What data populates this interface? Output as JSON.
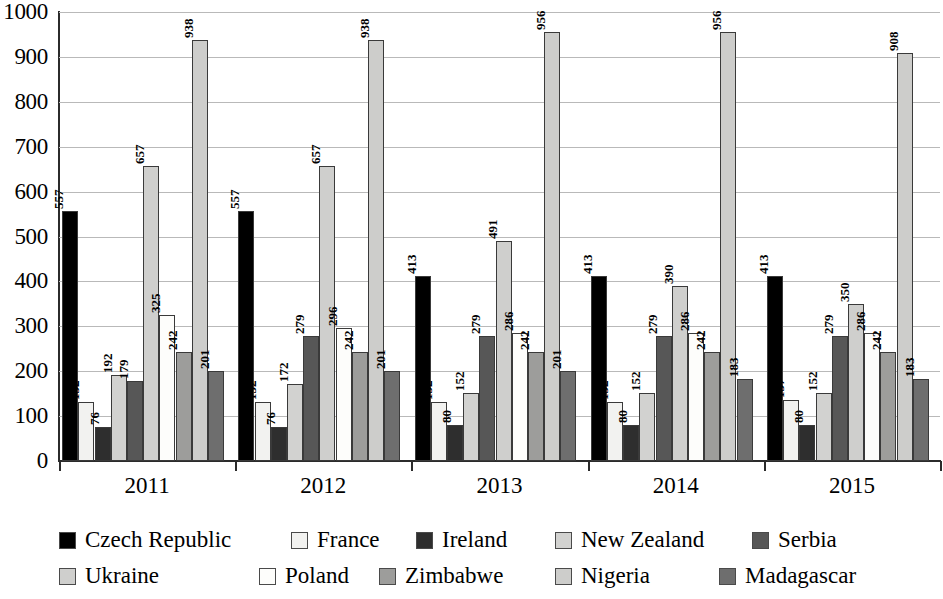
{
  "chart_data": {
    "type": "bar",
    "title": "",
    "subtitle": "",
    "xlabel": "",
    "ylabel": "",
    "categories": [
      "2011",
      "2012",
      "2013",
      "2014",
      "2015"
    ],
    "ylim": [
      0,
      1000
    ],
    "ytick_step": 100,
    "yticks": [
      "1000",
      "900",
      "800",
      "700",
      "600",
      "500",
      "400",
      "300",
      "200",
      "100",
      "0"
    ],
    "grid": true,
    "grid_axis": "y",
    "legend_position": "bottom",
    "data_labels": true,
    "data_label_orientation": "vertical",
    "series": [
      {
        "name": "Czech Republic",
        "color": "#000000",
        "values": [
          557,
          557,
          413,
          413,
          413
        ]
      },
      {
        "name": "France",
        "color": "#f2f2f0",
        "values": [
          132,
          132,
          132,
          132,
          137
        ]
      },
      {
        "name": "Ireland",
        "color": "#2e2e2e",
        "values": [
          76,
          76,
          80,
          80,
          80
        ]
      },
      {
        "name": "New Zealand",
        "color": "#d2d2d0",
        "values": [
          192,
          172,
          152,
          152,
          152
        ]
      },
      {
        "name": "Serbia",
        "color": "#575757",
        "values": [
          179,
          279,
          279,
          279,
          279
        ]
      },
      {
        "name": "Ukraine",
        "color": "#cfcfcd",
        "values": [
          657,
          657,
          491,
          390,
          350
        ]
      },
      {
        "name": "Poland",
        "color": "#fdfdfb",
        "values": [
          325,
          296,
          286,
          286,
          286
        ]
      },
      {
        "name": "Zimbabwe",
        "color": "#9d9d9b",
        "values": [
          242,
          242,
          242,
          242,
          242
        ]
      },
      {
        "name": "Nigeria",
        "color": "#cdcdcb",
        "values": [
          938,
          938,
          956,
          956,
          908
        ]
      },
      {
        "name": "Madagascar",
        "color": "#6e6e6e",
        "values": [
          201,
          201,
          201,
          183,
          183
        ]
      }
    ]
  },
  "legend": {
    "rows": [
      [
        {
          "label": "Czech Republic",
          "swatch": "#000000",
          "x": 0
        },
        {
          "label": "France",
          "swatch": "#f2f2f0",
          "x": 232
        },
        {
          "label": "Ireland",
          "swatch": "#2e2e2e",
          "x": 357
        },
        {
          "label": "New Zealand",
          "swatch": "#d2d2d0",
          "x": 496
        },
        {
          "label": "Serbia",
          "swatch": "#575757",
          "x": 693
        }
      ],
      [
        {
          "label": "Ukraine",
          "swatch": "#cfcfcd",
          "x": 0
        },
        {
          "label": "Poland",
          "swatch": "#fdfdfb",
          "x": 200
        },
        {
          "label": "Zimbabwe",
          "swatch": "#9d9d9b",
          "x": 320
        },
        {
          "label": "Nigeria",
          "swatch": "#cdcdcb",
          "x": 496
        },
        {
          "label": "Madagascar",
          "swatch": "#6e6e6e",
          "x": 660
        }
      ]
    ]
  }
}
